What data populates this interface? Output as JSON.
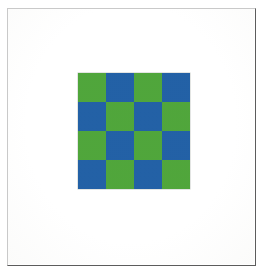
{
  "figure": {
    "background_color": "#ffffff",
    "frame": {
      "border_color_light": "#c9c9c9",
      "border_color_dark": "#5c5c5c"
    }
  },
  "chart_data": {
    "type": "heatmap",
    "subtitle": "",
    "xlabel": "",
    "ylabel": "",
    "rows": 4,
    "cols": 4,
    "grid": [
      [
        "green",
        "blue",
        "green",
        "blue"
      ],
      [
        "blue",
        "green",
        "blue",
        "green"
      ],
      [
        "green",
        "blue",
        "green",
        "blue"
      ],
      [
        "blue",
        "green",
        "blue",
        "green"
      ]
    ],
    "values": [
      [
        0,
        1,
        0,
        1
      ],
      [
        1,
        0,
        1,
        0
      ],
      [
        0,
        1,
        0,
        1
      ],
      [
        1,
        0,
        1,
        0
      ]
    ],
    "legend": [
      {
        "name": "green",
        "value": 0,
        "color": "#4FA63A"
      },
      {
        "name": "blue",
        "value": 1,
        "color": "#2160A6"
      }
    ],
    "colors": {
      "green": "#4FA63A",
      "blue": "#2160A6",
      "gridline": "#f2f3f0"
    },
    "grid_on": true,
    "legend_position": "none",
    "xticklabels": [],
    "yticklabels": []
  }
}
